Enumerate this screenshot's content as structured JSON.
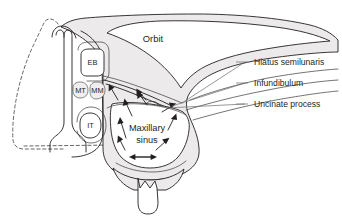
{
  "figure": {
    "background_color": "#ffffff",
    "line_color": "#231f20",
    "fill_color": "#eceaea",
    "width": 342,
    "height": 222
  },
  "region_labels": {
    "orbit": "Orbit",
    "maxillary_sinus_line1": "Maxillary",
    "maxillary_sinus_line2": "sinus"
  },
  "abbreviations": [
    {
      "key": "eb",
      "text": "EB"
    },
    {
      "key": "mt",
      "text": "MT"
    },
    {
      "key": "mm",
      "text": "MM"
    },
    {
      "key": "it",
      "text": "IT"
    }
  ],
  "callouts": [
    {
      "key": "hiatus",
      "text": "Hiatus semilunaris"
    },
    {
      "key": "infundibulum",
      "text": "Infundibulum"
    },
    {
      "key": "uncinate",
      "text": "Uncinate process"
    }
  ]
}
